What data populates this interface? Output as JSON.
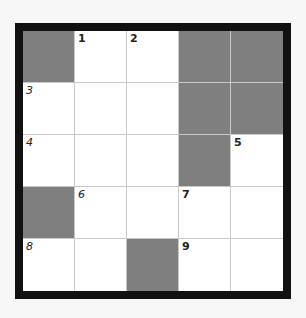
{
  "puzzle": {
    "type": "crossword",
    "rows": 5,
    "cols": 5,
    "colors": {
      "block": "#7f7f7f",
      "cell": "#ffffff",
      "border": "#111111",
      "gridline": "#c8c8c8"
    },
    "cells": [
      {
        "r": 0,
        "c": 0,
        "block": true
      },
      {
        "r": 0,
        "c": 1,
        "num": "1"
      },
      {
        "r": 0,
        "c": 2,
        "num": "2"
      },
      {
        "r": 0,
        "c": 3,
        "block": true
      },
      {
        "r": 0,
        "c": 4,
        "block": true
      },
      {
        "r": 1,
        "c": 0,
        "num": "3"
      },
      {
        "r": 1,
        "c": 1
      },
      {
        "r": 1,
        "c": 2
      },
      {
        "r": 1,
        "c": 3,
        "block": true
      },
      {
        "r": 1,
        "c": 4,
        "block": true
      },
      {
        "r": 2,
        "c": 0,
        "num": "4"
      },
      {
        "r": 2,
        "c": 1
      },
      {
        "r": 2,
        "c": 2
      },
      {
        "r": 2,
        "c": 3,
        "block": true
      },
      {
        "r": 2,
        "c": 4,
        "num": "5"
      },
      {
        "r": 3,
        "c": 0,
        "block": true
      },
      {
        "r": 3,
        "c": 1,
        "num": "6"
      },
      {
        "r": 3,
        "c": 2
      },
      {
        "r": 3,
        "c": 3,
        "num": "7"
      },
      {
        "r": 3,
        "c": 4
      },
      {
        "r": 4,
        "c": 0,
        "num": "8"
      },
      {
        "r": 4,
        "c": 1
      },
      {
        "r": 4,
        "c": 2,
        "block": true
      },
      {
        "r": 4,
        "c": 3,
        "num": "9"
      },
      {
        "r": 4,
        "c": 4
      }
    ]
  }
}
